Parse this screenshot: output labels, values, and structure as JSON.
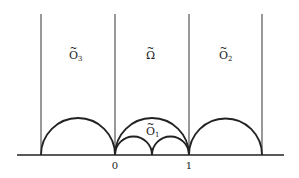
{
  "figure": {
    "labels": {
      "region_left": {
        "base": "O",
        "sub": "3",
        "tilde": "~"
      },
      "region_center": {
        "base": "Ω",
        "sub": "",
        "tilde": "~"
      },
      "region_right": {
        "base": "O",
        "sub": "2",
        "tilde": "~"
      },
      "region_arc": {
        "base": "O",
        "sub": "1",
        "tilde": "~"
      }
    },
    "ticks": {
      "zero": "0",
      "one": "1"
    },
    "colors": {
      "stroke": "#222222",
      "background": "#ffffff"
    }
  }
}
